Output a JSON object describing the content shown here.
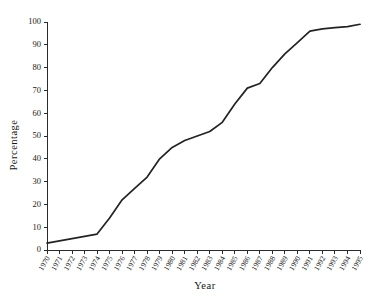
{
  "chart_data": {
    "type": "line",
    "title": "",
    "xlabel": "Year",
    "ylabel": "Percentage",
    "xlim": [
      1970,
      1995
    ],
    "ylim": [
      0,
      100
    ],
    "grid": false,
    "legend": "none",
    "x": [
      1970,
      1971,
      1972,
      1973,
      1974,
      1975,
      1976,
      1977,
      1978,
      1979,
      1980,
      1981,
      1982,
      1983,
      1984,
      1985,
      1986,
      1987,
      1988,
      1989,
      1990,
      1991,
      1992,
      1993,
      1994,
      1995
    ],
    "categories": [
      "1970",
      "1971",
      "1972",
      "1973",
      "1974",
      "1975",
      "1976",
      "1977",
      "1978",
      "1979",
      "1980",
      "1981",
      "1982",
      "1983",
      "1984",
      "1985",
      "1986",
      "1987",
      "1988",
      "1989",
      "1990",
      "1991",
      "1992",
      "1993",
      "1994",
      "1995"
    ],
    "values": [
      3,
      4,
      5,
      6,
      7,
      14,
      22,
      27,
      32,
      40,
      45,
      48,
      50,
      52,
      56,
      64,
      71,
      73,
      80,
      86,
      91,
      96,
      97,
      97.5,
      98,
      99
    ],
    "series": [
      {
        "name": "Percentage",
        "values": [
          3,
          4,
          5,
          6,
          7,
          14,
          22,
          27,
          32,
          40,
          45,
          48,
          50,
          52,
          56,
          64,
          71,
          73,
          80,
          86,
          91,
          96,
          97,
          97.5,
          98,
          99
        ],
        "color": "#232323"
      }
    ],
    "ytick_labels": [
      "0",
      "10",
      "20",
      "30",
      "40",
      "50",
      "60",
      "70",
      "80",
      "90",
      "100"
    ],
    "ytick_values": [
      0,
      10,
      20,
      30,
      40,
      50,
      60,
      70,
      80,
      90,
      100
    ],
    "annotations": []
  },
  "axis_titles": {
    "x": "Year",
    "y": "Percentage"
  }
}
